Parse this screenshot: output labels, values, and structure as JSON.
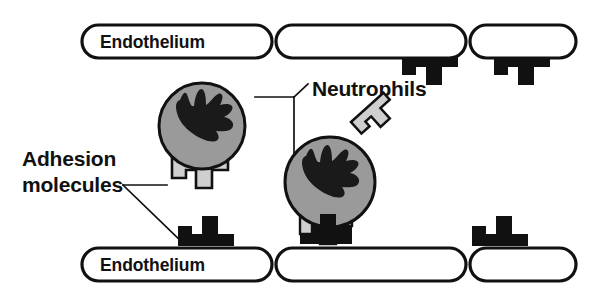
{
  "figure": {
    "type": "biomedical-schematic",
    "background_color": "#ffffff",
    "line_color": "#111111"
  },
  "labels": {
    "neutrophils": "Neutrophils",
    "adhesion_line1": "Adhesion",
    "adhesion_line2": "molecules"
  },
  "colors": {
    "outline": "#111111",
    "cell_fill": "#ffffff",
    "neutrophil_fill": "#9a9a9a",
    "nucleus_fill": "#1a1a1a",
    "receptor_light": "#cfcfcf",
    "receptor_dark": "#111111",
    "text": "#111111"
  },
  "endothelium": {
    "label": "Endothelium",
    "top_row": [
      {
        "id": "top-cell-1",
        "label": "Endothelium",
        "x": 82,
        "y": 25,
        "w": 190,
        "h": 33
      },
      {
        "id": "top-cell-2",
        "label": "",
        "x": 276,
        "y": 25,
        "w": 190,
        "h": 33
      },
      {
        "id": "top-cell-3",
        "label": "",
        "x": 470,
        "y": 25,
        "w": 106,
        "h": 33
      }
    ],
    "bottom_row": [
      {
        "id": "bottom-cell-1",
        "label": "Endothelium",
        "x": 82,
        "y": 248,
        "w": 190,
        "h": 33
      },
      {
        "id": "bottom-cell-2",
        "label": "",
        "x": 276,
        "y": 248,
        "w": 190,
        "h": 33
      },
      {
        "id": "bottom-cell-3",
        "label": "",
        "x": 470,
        "y": 248,
        "w": 106,
        "h": 33
      }
    ]
  },
  "adhesion_molecules": {
    "name": "Adhesion molecules",
    "endothelial_top": [
      {
        "id": "top-receptor-1",
        "x": 403,
        "y": 57,
        "orientation": "down",
        "color": "#111111"
      },
      {
        "id": "top-receptor-2",
        "x": 495,
        "y": 57,
        "orientation": "down",
        "color": "#111111"
      }
    ],
    "endothelial_bottom": [
      {
        "id": "bottom-receptor-1",
        "x": 178,
        "y": 216,
        "orientation": "up",
        "color": "#111111"
      },
      {
        "id": "bottom-receptor-2",
        "x": 300,
        "y": 216,
        "orientation": "up",
        "color": "#111111"
      },
      {
        "id": "bottom-receptor-3",
        "x": 472,
        "y": 216,
        "orientation": "up",
        "color": "#111111"
      }
    ],
    "neutrophil_ligands": [
      {
        "id": "neutrophil-1-ligand",
        "x": 172,
        "y": 158,
        "orientation": "down",
        "color": "#cfcfcf"
      },
      {
        "id": "neutrophil-2-ligand-bottom",
        "x": 296,
        "y": 216,
        "orientation": "down",
        "color": "#cfcfcf"
      },
      {
        "id": "neutrophil-2-ligand-side",
        "x": 345,
        "y": 120,
        "orientation": "rotated",
        "rotation_deg": -40,
        "color": "#cfcfcf"
      }
    ]
  },
  "neutrophils": {
    "name": "Neutrophils",
    "cells": [
      {
        "id": "neutrophil-1",
        "cx": 202,
        "cy": 126,
        "r": 43,
        "state": "rolling"
      },
      {
        "id": "neutrophil-2",
        "cx": 330,
        "cy": 182,
        "r": 45,
        "state": "adherent"
      }
    ]
  },
  "leaders": {
    "neutrophils_label_pos": {
      "x": 312,
      "y": 96
    },
    "adhesion_label_pos": {
      "x": 22,
      "y": 166
    }
  }
}
